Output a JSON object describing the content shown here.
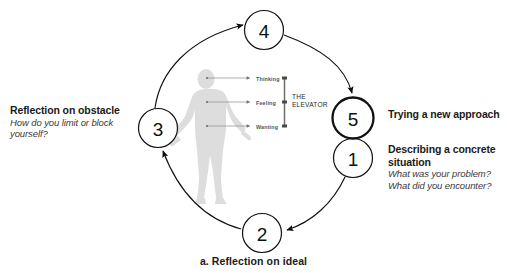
{
  "diagram": {
    "caption": "a. Reflection on ideal",
    "nodes": [
      {
        "id": "node-4",
        "number": "4",
        "cx": 264,
        "cy": 30,
        "r": 19.5,
        "bold": false
      },
      {
        "id": "node-5",
        "number": "5",
        "cx": 353,
        "cy": 118,
        "r": 20.5,
        "bold": true
      },
      {
        "id": "node-1",
        "number": "1",
        "cx": 353,
        "cy": 158,
        "r": 19.5,
        "bold": false
      },
      {
        "id": "node-2",
        "number": "2",
        "cx": 262,
        "cy": 233,
        "r": 19.5,
        "bold": false
      },
      {
        "id": "node-3",
        "number": "3",
        "cx": 158,
        "cy": 128,
        "r": 19.5,
        "bold": false
      }
    ],
    "left_annotation": {
      "heading": "Reflection on obstacle",
      "lines": [
        "How do you limit or block",
        "yourself?"
      ]
    },
    "right_annotation_top": {
      "heading": "Trying a new approach",
      "lines": []
    },
    "right_annotation_bottom": {
      "heading_line1": "Describing a concrete",
      "heading_line2": "situation",
      "lines": [
        "What was your problem?",
        "What did you encounter?"
      ]
    },
    "elevator": {
      "title_line1": "THE",
      "title_line2": "ELEVATOR",
      "levels": [
        "Thinking",
        "Feeling",
        "Wanting"
      ]
    },
    "figure": {
      "name": "human-silhouette"
    },
    "colors": {
      "stroke": "#111111",
      "text": "#1a1a1a",
      "subtext": "#3a3a3a",
      "silhouette": "#d8d8d8",
      "elevator_bar": "#6e6e6e",
      "elevator_label": "#555555",
      "background": "#ffffff"
    }
  }
}
